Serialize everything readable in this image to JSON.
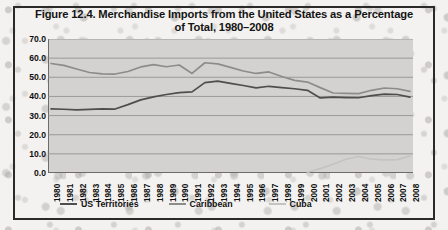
{
  "figure": {
    "title_line_1": "Figure 12.4. Merchandise Imports from the United States as a Percentage",
    "title_line_2": "of Total, 1980–2008"
  },
  "colors": {
    "plot_background": "#d3d2d0",
    "gridline": "#8d8c8a",
    "axis": "#6d6c6a",
    "us_territories": "#4e4e4c",
    "caribbean": "#8c8c8a",
    "cuba": "#c3c3c1",
    "page_background": "#f3f2f0",
    "frame_border": "#2a2a28",
    "text": "#111111"
  },
  "legend": {
    "position": "bottom",
    "entries": [
      {
        "label": "US Territories",
        "color": "#4e4e4c"
      },
      {
        "label": "Caribbean",
        "color": "#8c8c8a"
      },
      {
        "label": "Cuba",
        "color": "#c3c3c1"
      }
    ]
  },
  "chart_data": {
    "type": "line",
    "title": "Figure 12.4. Merchandise Imports from the United States as a Percentage of Total, 1980–2008",
    "xlabel": "",
    "ylabel": "",
    "ylim": [
      0,
      70
    ],
    "yticks": [
      "0.0",
      "10.0",
      "20.0",
      "30.0",
      "40.0",
      "50.0",
      "60.0",
      "70.0"
    ],
    "ytick_values": [
      0,
      10,
      20,
      30,
      40,
      50,
      60,
      70
    ],
    "grid": true,
    "grid_axis": "y",
    "legend_position": "bottom",
    "x": [
      1980,
      1981,
      1982,
      1983,
      1984,
      1985,
      1986,
      1987,
      1988,
      1989,
      1990,
      1991,
      1992,
      1993,
      1994,
      1995,
      1996,
      1997,
      1998,
      1999,
      2000,
      2001,
      2002,
      2003,
      2004,
      2005,
      2006,
      2007,
      2008
    ],
    "xticks": [
      "1980",
      "1981",
      "1982",
      "1983",
      "1984",
      "1985",
      "1986",
      "1987",
      "1988",
      "1989",
      "1990",
      "1991",
      "1992",
      "1993",
      "1994",
      "1995",
      "1996",
      "1997",
      "1998",
      "1999",
      "2000",
      "2001",
      "2002",
      "2003",
      "2004",
      "2005",
      "2006",
      "2007",
      "2008"
    ],
    "series": [
      {
        "name": "US Territories",
        "color": "#4e4e4c",
        "values": [
          33.5,
          33.3,
          33.0,
          33.2,
          33.5,
          33.4,
          35.7,
          38.2,
          39.8,
          41.0,
          42.0,
          42.4,
          47.2,
          48.0,
          46.8,
          45.7,
          44.5,
          45.3,
          44.6,
          44.0,
          43.2,
          39.2,
          39.6,
          39.4,
          39.3,
          40.4,
          41.2,
          41.0,
          39.6
        ]
      },
      {
        "name": "Caribbean",
        "color": "#8c8c8a",
        "values": [
          57.2,
          56.2,
          54.3,
          52.5,
          51.8,
          51.7,
          53.0,
          55.4,
          56.6,
          55.5,
          56.4,
          52.0,
          57.6,
          57.0,
          55.2,
          53.3,
          52.0,
          52.8,
          50.4,
          48.4,
          47.5,
          44.6,
          41.8,
          41.6,
          41.5,
          43.2,
          44.4,
          44.0,
          42.6
        ]
      },
      {
        "name": "Cuba",
        "color": "#c3c3c1",
        "values": [
          null,
          null,
          null,
          null,
          null,
          null,
          null,
          null,
          null,
          null,
          null,
          null,
          null,
          null,
          null,
          null,
          null,
          null,
          null,
          null,
          0.4,
          2.3,
          4.6,
          7.2,
          8.6,
          7.2,
          6.9,
          7.0,
          8.9
        ]
      }
    ]
  }
}
